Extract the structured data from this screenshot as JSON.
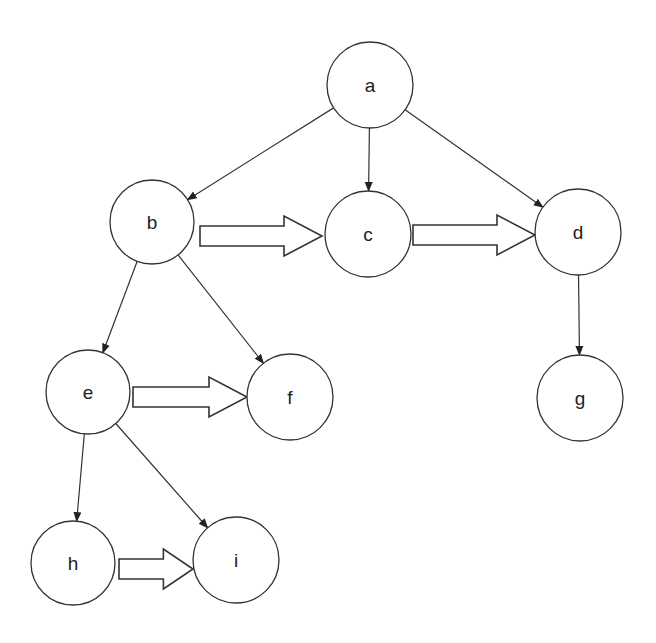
{
  "diagram": {
    "type": "tree",
    "nodes": [
      {
        "id": "a",
        "label": "a",
        "cx": 370,
        "cy": 85,
        "r": 43
      },
      {
        "id": "b",
        "label": "b",
        "cx": 152,
        "cy": 222,
        "r": 42
      },
      {
        "id": "c",
        "label": "c",
        "cx": 368,
        "cy": 234,
        "r": 43
      },
      {
        "id": "d",
        "label": "d",
        "cx": 578,
        "cy": 232,
        "r": 43
      },
      {
        "id": "e",
        "label": "e",
        "cx": 88,
        "cy": 392,
        "r": 42
      },
      {
        "id": "f",
        "label": "f",
        "cx": 290,
        "cy": 397,
        "r": 43
      },
      {
        "id": "g",
        "label": "g",
        "cx": 580,
        "cy": 398,
        "r": 43
      },
      {
        "id": "h",
        "label": "h",
        "cx": 73,
        "cy": 563,
        "r": 42
      },
      {
        "id": "i",
        "label": "i",
        "cx": 236,
        "cy": 560,
        "r": 43
      }
    ],
    "tree_edges": [
      {
        "from": "a",
        "to": "b"
      },
      {
        "from": "a",
        "to": "c"
      },
      {
        "from": "a",
        "to": "d"
      },
      {
        "from": "b",
        "to": "e"
      },
      {
        "from": "b",
        "to": "f"
      },
      {
        "from": "d",
        "to": "g"
      },
      {
        "from": "e",
        "to": "h"
      },
      {
        "from": "e",
        "to": "i"
      }
    ],
    "sibling_arrows": [
      {
        "from": "b",
        "to": "c",
        "x1": 200,
        "x2": 322,
        "y": 236
      },
      {
        "from": "c",
        "to": "d",
        "x1": 413,
        "x2": 535,
        "y": 235
      },
      {
        "from": "e",
        "to": "f",
        "x1": 133,
        "x2": 247,
        "y": 397
      },
      {
        "from": "h",
        "to": "i",
        "x1": 119,
        "x2": 193,
        "y": 569
      }
    ],
    "colors": {
      "stroke": "#333333",
      "fill": "#ffffff",
      "text": "#222222"
    }
  }
}
